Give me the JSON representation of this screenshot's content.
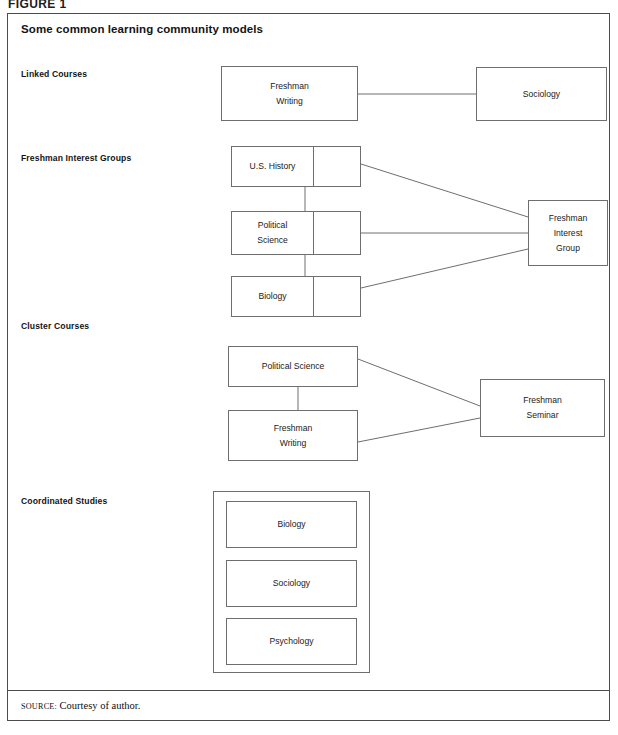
{
  "figure": {
    "number_label": "FIGURE 1",
    "title": "Some common learning community models",
    "source_prefix": "SOURCE:",
    "source_text": "Courtesy of author."
  },
  "colors": {
    "frame_border": "#4c4c4c",
    "box_border": "#6e6e6e",
    "connector": "#6e6e6e",
    "text": "#1a1a1a",
    "background": "#ffffff"
  },
  "sections": [
    {
      "id": "linked-courses",
      "label": "Linked Courses",
      "nodes": [
        {
          "id": "freshman-writing-1",
          "line1": "Freshman",
          "line2": "Writing"
        },
        {
          "id": "sociology-1",
          "line1": "Sociology",
          "line2": ""
        }
      ]
    },
    {
      "id": "freshman-interest-groups",
      "label": "Freshman Interest Groups",
      "nodes": [
        {
          "id": "us-history",
          "line1": "U.S. History",
          "line2": ""
        },
        {
          "id": "political-science-fig",
          "line1": "Political",
          "line2": "Science"
        },
        {
          "id": "biology-fig",
          "line1": "Biology",
          "line2": ""
        },
        {
          "id": "freshman-interest-group",
          "line1": "Freshman",
          "line2": "Interest",
          "line3": "Group"
        }
      ]
    },
    {
      "id": "cluster-courses",
      "label": "Cluster Courses",
      "nodes": [
        {
          "id": "political-science-cluster",
          "line1": "Political Science",
          "line2": ""
        },
        {
          "id": "freshman-writing-2",
          "line1": "Freshman",
          "line2": "Writing"
        },
        {
          "id": "freshman-seminar",
          "line1": "Freshman",
          "line2": "Seminar"
        }
      ]
    },
    {
      "id": "coordinated-studies",
      "label": "Coordinated Studies",
      "nodes": [
        {
          "id": "biology-cs",
          "line1": "Biology",
          "line2": ""
        },
        {
          "id": "sociology-cs",
          "line1": "Sociology",
          "line2": ""
        },
        {
          "id": "psychology-cs",
          "line1": "Psychology",
          "line2": ""
        }
      ]
    }
  ],
  "diagram_data": {
    "type": "diagram",
    "description": "Four learning community model schematics showing how courses are combined.",
    "models": [
      {
        "name": "Linked Courses",
        "boxes": [
          "Freshman Writing",
          "Sociology"
        ],
        "edges": [
          [
            "Freshman Writing",
            "Sociology"
          ]
        ]
      },
      {
        "name": "Freshman Interest Groups",
        "boxes": [
          "U.S. History",
          "Political Science",
          "Biology",
          "Freshman Interest Group"
        ],
        "edges": [
          [
            "U.S. History",
            "Political Science"
          ],
          [
            "Political Science",
            "Biology"
          ],
          [
            "U.S. History",
            "Freshman Interest Group"
          ],
          [
            "Political Science",
            "Freshman Interest Group"
          ],
          [
            "Biology",
            "Freshman Interest Group"
          ]
        ]
      },
      {
        "name": "Cluster Courses",
        "boxes": [
          "Political Science",
          "Freshman Writing",
          "Freshman Seminar"
        ],
        "edges": [
          [
            "Political Science",
            "Freshman Writing"
          ],
          [
            "Political Science",
            "Freshman Seminar"
          ],
          [
            "Freshman Writing",
            "Freshman Seminar"
          ]
        ]
      },
      {
        "name": "Coordinated Studies",
        "boxes": [
          "Biology",
          "Sociology",
          "Psychology"
        ],
        "edges": [],
        "note": "All three courses enclosed in a single containing frame."
      }
    ]
  }
}
